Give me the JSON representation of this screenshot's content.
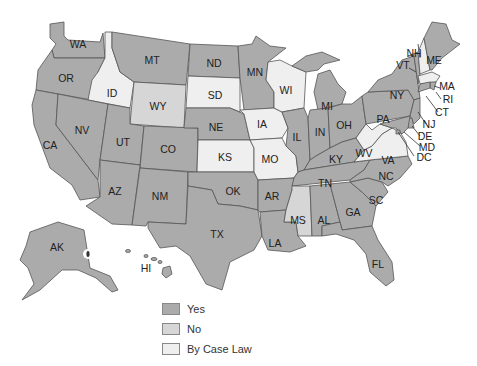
{
  "colors": {
    "yes": "#ababab",
    "no": "#d6d6d6",
    "case_law": "#efefef"
  },
  "legend": {
    "items": [
      {
        "key": "yes",
        "label": "Yes"
      },
      {
        "key": "no",
        "label": "No"
      },
      {
        "key": "case_law",
        "label": "By Case Law"
      }
    ]
  },
  "states": {
    "WA": "yes",
    "OR": "yes",
    "CA": "yes",
    "ID": "case_law",
    "NV": "yes",
    "MT": "yes",
    "WY": "no",
    "UT": "yes",
    "CO": "yes",
    "AZ": "yes",
    "NM": "yes",
    "ND": "yes",
    "SD": "case_law",
    "NE": "yes",
    "KS": "case_law",
    "OK": "yes",
    "TX": "yes",
    "MN": "yes",
    "IA": "case_law",
    "MO": "case_law",
    "AR": "yes",
    "LA": "yes",
    "WI": "case_law",
    "IL": "yes",
    "MI": "yes",
    "IN": "yes",
    "OH": "yes",
    "KY": "yes",
    "TN": "yes",
    "MS": "no",
    "AL": "yes",
    "GA": "yes",
    "FL": "yes",
    "SC": "yes",
    "NC": "yes",
    "VA": "case_law",
    "WV": "case_law",
    "PA": "yes",
    "NY": "yes",
    "VT": "yes",
    "NH": "case_law",
    "ME": "yes",
    "MA": "case_law",
    "RI": "yes",
    "CT": "yes",
    "NJ": "yes",
    "DE": "yes",
    "MD": "yes",
    "DC": "yes",
    "AK": "yes",
    "HI": "yes"
  },
  "labels": {
    "WA": "WA",
    "OR": "OR",
    "CA": "CA",
    "ID": "ID",
    "NV": "NV",
    "MT": "MT",
    "WY": "WY",
    "UT": "UT",
    "CO": "CO",
    "AZ": "AZ",
    "NM": "NM",
    "ND": "ND",
    "SD": "SD",
    "NE": "NE",
    "KS": "KS",
    "OK": "OK",
    "TX": "TX",
    "MN": "MN",
    "IA": "IA",
    "MO": "MO",
    "AR": "AR",
    "LA": "LA",
    "WI": "WI",
    "IL": "IL",
    "MI": "MI",
    "IN": "IN",
    "OH": "OH",
    "KY": "KY",
    "TN": "TN",
    "MS": "MS",
    "AL": "AL",
    "GA": "GA",
    "FL": "FL",
    "SC": "SC",
    "NC": "NC",
    "VA": "VA",
    "WV": "WV",
    "PA": "PA",
    "NY": "NY",
    "VT": "VT",
    "NH": "NH",
    "ME": "ME",
    "MA": "MA",
    "RI": "RI",
    "CT": "CT",
    "NJ": "NJ",
    "DE": "DE",
    "MD": "MD",
    "DC": "DC",
    "AK": "AK",
    "HI": "HI"
  }
}
